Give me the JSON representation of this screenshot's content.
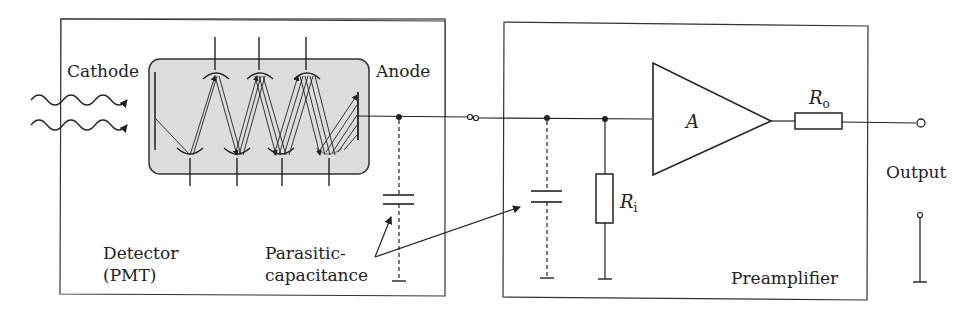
{
  "diagram": {
    "type": "circuit-schematic",
    "labels": {
      "cathode": "Cathode",
      "anode": "Anode",
      "detector_line1": "Detector",
      "detector_line2": "(PMT)",
      "parasitic_line1": "Parasitic-",
      "parasitic_line2": "capacitance",
      "amplifier_gain": "A",
      "input_resistor": "R",
      "input_resistor_sub": "i",
      "output_resistor": "R",
      "output_resistor_sub": "o",
      "output": "Output",
      "preamplifier": "Preamplifier"
    },
    "blocks": [
      {
        "name": "Detector (PMT)",
        "contains": [
          "photocathode",
          "dynode chain",
          "anode",
          "parasitic capacitance"
        ]
      },
      {
        "name": "Preamplifier",
        "contains": [
          "parasitic capacitance",
          "input resistor Ri",
          "amplifier A",
          "output resistor Ro"
        ]
      }
    ],
    "colors": {
      "line": "#222222",
      "pmt_fill": "#dcdcdc",
      "background": "#ffffff"
    }
  }
}
